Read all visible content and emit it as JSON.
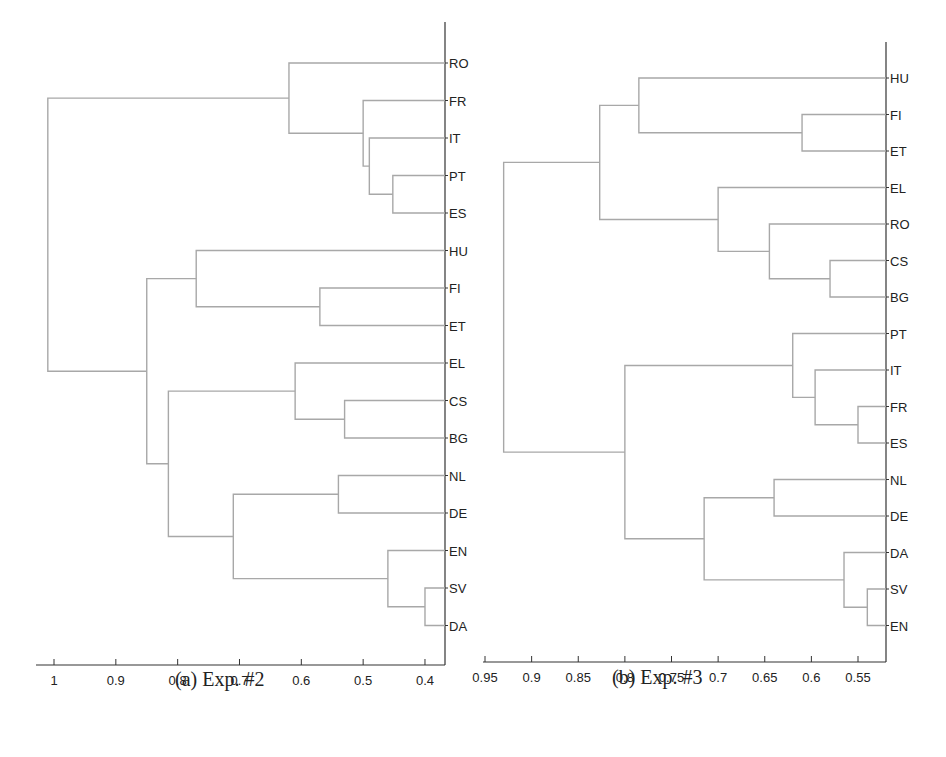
{
  "chart_data": [
    {
      "type": "dendrogram",
      "caption": "(a) Exp. #2",
      "orientation": "leaves-right",
      "xlim": [
        1.03,
        0.37
      ],
      "xticks": [
        "1",
        "0.9",
        "0.8",
        "0.7",
        "0.6",
        "0.5",
        "0.4"
      ],
      "xtick_values": [
        1,
        0.9,
        0.8,
        0.7,
        0.6,
        0.5,
        0.4
      ],
      "leaves": [
        "RO",
        "FR",
        "IT",
        "PT",
        "ES",
        "HU",
        "FI",
        "ET",
        "EL",
        "CS",
        "BG",
        "NL",
        "DE",
        "EN",
        "SV",
        "DA"
      ],
      "merges": [
        {
          "left": "PT",
          "right": "ES",
          "height": 0.452
        },
        {
          "left": "IT",
          "right": "PT+ES",
          "height": 0.49
        },
        {
          "left": "FR",
          "right": "IT+PT+ES",
          "height": 0.5
        },
        {
          "left": "RO",
          "right": "FR+IT+PT+ES",
          "height": 0.62
        },
        {
          "left": "FI",
          "right": "ET",
          "height": 0.57
        },
        {
          "left": "HU",
          "right": "FI+ET",
          "height": 0.77
        },
        {
          "left": "CS",
          "right": "BG",
          "height": 0.53
        },
        {
          "left": "EL",
          "right": "CS+BG",
          "height": 0.61
        },
        {
          "left": "NL",
          "right": "DE",
          "height": 0.54
        },
        {
          "left": "SV",
          "right": "DA",
          "height": 0.4
        },
        {
          "left": "EN",
          "right": "SV+DA",
          "height": 0.46
        },
        {
          "left": "NL+DE",
          "right": "EN+SV+DA",
          "height": 0.71
        },
        {
          "left": "EL+CS+BG",
          "right": "NL+DE+EN+SV+DA",
          "height": 0.815
        },
        {
          "left": "HU+FI+ET",
          "right": "EL+CS+BG+NL+DE+EN+SV+DA",
          "height": 0.85
        },
        {
          "left": "RO+FR+IT+PT+ES",
          "right": "HU+FI+ET+EL+CS+BG+NL+DE+EN+SV+DA",
          "height": 1.01
        }
      ]
    },
    {
      "type": "dendrogram",
      "caption": "(b) Exp. #3",
      "orientation": "leaves-right",
      "xlim": [
        0.95,
        0.52
      ],
      "xticks": [
        "0.95",
        "0.9",
        "0.85",
        "0.8",
        "0.75",
        "0.7",
        "0.65",
        "0.6",
        "0.55"
      ],
      "xtick_values": [
        0.95,
        0.9,
        0.85,
        0.8,
        0.75,
        0.7,
        0.65,
        0.6,
        0.55
      ],
      "leaves": [
        "HU",
        "FI",
        "ET",
        "EL",
        "RO",
        "CS",
        "BG",
        "PT",
        "IT",
        "FR",
        "ES",
        "NL",
        "DE",
        "DA",
        "SV",
        "EN"
      ],
      "merges": [
        {
          "left": "FI",
          "right": "ET",
          "height": 0.61
        },
        {
          "left": "HU",
          "right": "FI+ET",
          "height": 0.785
        },
        {
          "left": "CS",
          "right": "BG",
          "height": 0.58
        },
        {
          "left": "RO",
          "right": "CS+BG",
          "height": 0.645
        },
        {
          "left": "EL",
          "right": "RO+CS+BG",
          "height": 0.7
        },
        {
          "left": "HU+FI+ET",
          "right": "EL+RO+CS+BG",
          "height": 0.827
        },
        {
          "left": "FR",
          "right": "ES",
          "height": 0.55
        },
        {
          "left": "IT",
          "right": "FR+ES",
          "height": 0.596
        },
        {
          "left": "PT",
          "right": "IT+FR+ES",
          "height": 0.62
        },
        {
          "left": "NL",
          "right": "DE",
          "height": 0.64
        },
        {
          "left": "SV",
          "right": "EN",
          "height": 0.54
        },
        {
          "left": "DA",
          "right": "SV+EN",
          "height": 0.565
        },
        {
          "left": "NL+DE",
          "right": "DA+SV+EN",
          "height": 0.715
        },
        {
          "left": "PT+IT+FR+ES",
          "right": "NL+DE+DA+SV+EN",
          "height": 0.8
        },
        {
          "left": "HU+FI+ET+EL+RO+CS+BG",
          "right": "PT+IT+FR+ES+NL+DE+DA+SV+EN",
          "height": 0.93
        }
      ]
    }
  ],
  "colors": {
    "link": "#a8a8a8",
    "axis": "#333333",
    "text": "#222222"
  }
}
